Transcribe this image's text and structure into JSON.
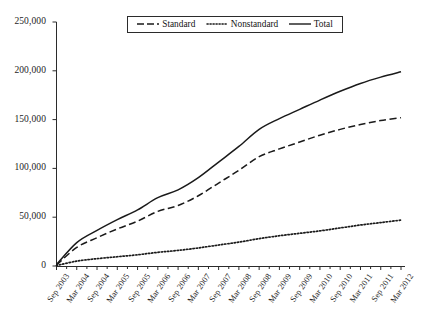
{
  "chart_data": {
    "type": "line",
    "title": "",
    "xlabel": "",
    "ylabel": "",
    "ylim": [
      0,
      250000
    ],
    "grid": false,
    "legend_position": "top-center",
    "yticks": [
      "0",
      "50,000",
      "100,000",
      "150,000",
      "200,000",
      "250,000"
    ],
    "ytick_values": [
      0,
      50000,
      100000,
      150000,
      200000,
      250000
    ],
    "categories": [
      "Sep 2003",
      "Mar 2004",
      "Sep 2004",
      "Mar 2005",
      "Sep 2005",
      "Mar 2006",
      "Sep 2006",
      "Mar 2007",
      "Sep 2007",
      "Mar 2008",
      "Sep 2008",
      "Mar 2009",
      "Sep 2009",
      "Mar 2010",
      "Sep 2010",
      "Mar 2011",
      "Sep 2011",
      "Mar 2012"
    ],
    "series": [
      {
        "name": "Standard",
        "style": "dashed",
        "color": "#1a1a1a",
        "values": [
          1000,
          19000,
          29000,
          38000,
          46000,
          56000,
          62000,
          72000,
          85000,
          98000,
          112000,
          120000,
          127000,
          134000,
          140000,
          145000,
          149000,
          152000
        ]
      },
      {
        "name": "Nonstandard",
        "style": "dotted",
        "color": "#1a1a1a",
        "values": [
          500,
          5000,
          7500,
          9500,
          11500,
          14000,
          16000,
          18500,
          21500,
          24500,
          28000,
          31000,
          33500,
          36000,
          39000,
          42000,
          44500,
          47000
        ]
      },
      {
        "name": "Total",
        "style": "solid",
        "color": "#1a1a1a",
        "values": [
          1500,
          24000,
          36500,
          47500,
          57500,
          70000,
          78000,
          90500,
          106500,
          122500,
          140000,
          151000,
          160500,
          170000,
          179000,
          187000,
          193500,
          199000
        ]
      }
    ]
  },
  "legend": {
    "items": [
      {
        "label": "Standard",
        "style": "dashed"
      },
      {
        "label": "Nonstandard",
        "style": "dotted"
      },
      {
        "label": "Total",
        "style": "solid"
      }
    ]
  }
}
